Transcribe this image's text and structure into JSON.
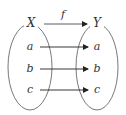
{
  "diagram": {
    "type": "function-mapping",
    "function_label": "f",
    "domain": {
      "label": "X",
      "elements": [
        "a",
        "b",
        "c"
      ]
    },
    "codomain": {
      "label": "Y",
      "elements": [
        "a",
        "b",
        "c"
      ]
    },
    "mappings": [
      {
        "from": "a",
        "to": "a"
      },
      {
        "from": "b",
        "to": "b"
      },
      {
        "from": "c",
        "to": "c"
      }
    ],
    "colors": {
      "stroke": "#333333",
      "background": "#ffffff"
    }
  }
}
